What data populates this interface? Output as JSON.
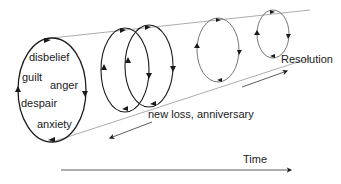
{
  "diagram": {
    "type": "spiral-cylinder grief model",
    "first_cycle_labels": [
      "disbelief",
      "guilt",
      "anger",
      "despair",
      "anxiety"
    ],
    "labels": {
      "disbelief": "disbelief",
      "guilt": "guilt",
      "anger": "anger",
      "despair": "despair",
      "anxiety": "anxiety",
      "new_loss": "new loss, anniversary",
      "resolution": "Resolution",
      "time": "Time"
    },
    "colors": {
      "ink": "#1a1a1a",
      "faded": "#777777"
    }
  }
}
